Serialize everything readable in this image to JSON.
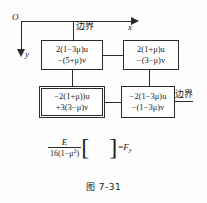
{
  "figure": {
    "caption": "图 7-31",
    "axes": {
      "origin_label": "O",
      "x_label": "x",
      "y_label": "y"
    },
    "boundary_labels": {
      "top": "边界",
      "right": "边界"
    },
    "nodes": [
      {
        "id": "top-left",
        "position": "top-left",
        "double_border": false,
        "line1": "2(1−3μ)u",
        "line2": "−(5+μ)v"
      },
      {
        "id": "top-right",
        "position": "top-right",
        "double_border": false,
        "line1": "2(1+μ)u",
        "line2": "−(3−μ)v"
      },
      {
        "id": "bottom-left",
        "position": "bottom-left",
        "double_border": true,
        "line1": "−2(1+μ))u",
        "line2": "+3(3−μ)v"
      },
      {
        "id": "bottom-right",
        "position": "bottom-right",
        "double_border": false,
        "line1": "−2(1−3μ)u",
        "line2": "−(1−3μ)v"
      }
    ],
    "formula": {
      "numerator": "E",
      "denominator_prefix": "16(1−μ",
      "denominator_exponent": "2",
      "denominator_suffix": ")",
      "bracket_open": "[",
      "bracket_close": "]",
      "equals": "=",
      "result_symbol": "F",
      "result_subscript": "y"
    },
    "colors": {
      "ink": "#2b2b2b",
      "background": "#fdfdfd"
    }
  }
}
